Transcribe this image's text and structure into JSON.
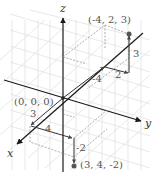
{
  "figure": {
    "type": "3d-coordinate-plot",
    "axes": {
      "x": "x",
      "y": "y",
      "z": "z"
    },
    "origin_label": "(0, 0, 0)",
    "points": [
      {
        "label": "(-4, 2, 3)",
        "coords": [
          -4,
          2,
          3
        ]
      },
      {
        "label": "(3, 4, -2)",
        "coords": [
          3,
          4,
          -2
        ]
      }
    ],
    "path1_labels": {
      "x_step": "-4",
      "y_step": "2",
      "z_step": "3"
    },
    "path2_labels": {
      "x_step": "3",
      "y_step": "4",
      "z_step": "-2"
    },
    "colors": {
      "axis": "#1a1a1a",
      "grid": "#d4d4d4",
      "path": "#444444",
      "dashed": "#777777",
      "point": "#555555"
    }
  }
}
